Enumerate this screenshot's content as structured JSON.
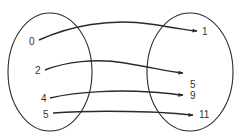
{
  "diagram": {
    "type": "mapping",
    "stroke_color": "#2a2a2a",
    "text_color": "#333333",
    "domain": {
      "shape": "ellipse",
      "cx": 50,
      "cy": 72,
      "rx": 42,
      "ry": 59,
      "elements": [
        {
          "label": "0",
          "x": 29,
          "y": 45
        },
        {
          "label": "2",
          "x": 35,
          "y": 74
        },
        {
          "label": "4",
          "x": 41,
          "y": 102
        },
        {
          "label": "5",
          "x": 43,
          "y": 118
        }
      ]
    },
    "codomain": {
      "shape": "ellipse",
      "cx": 190,
      "cy": 72,
      "rx": 43,
      "ry": 59,
      "elements": [
        {
          "label": "1",
          "x": 202,
          "y": 35
        },
        {
          "label": "5",
          "x": 190,
          "y": 88
        },
        {
          "label": "9",
          "x": 190,
          "y": 99
        },
        {
          "label": "11",
          "x": 199,
          "y": 118
        }
      ]
    },
    "mappings": [
      {
        "from": "0",
        "to": "1",
        "path": "M39,40 C70,26 110,18 150,24 S185,30 197,31"
      },
      {
        "from": "2",
        "to": "5",
        "path": "M45,70 C65,62 95,58 125,63 S170,72 183,73"
      },
      {
        "from": "4",
        "to": "9",
        "path": "M50,98 C80,91 120,90 150,92 S175,95 183,95"
      },
      {
        "from": "5",
        "to": "11",
        "path": "M53,113 C80,111 120,111 150,112 S185,115 193,115"
      }
    ]
  }
}
